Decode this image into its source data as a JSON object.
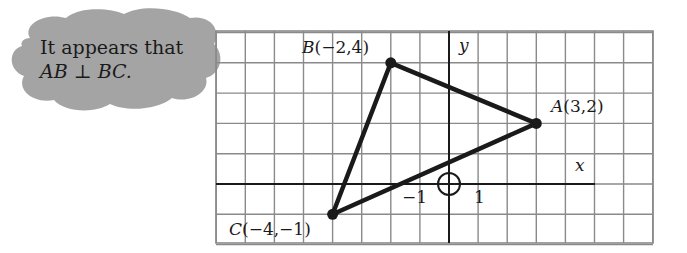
{
  "callout": {
    "line1": "It appears that",
    "line2_left": "AB",
    "line2_symbol": "⊥",
    "line2_right": "BC."
  },
  "axes": {
    "x_label": "x",
    "y_label": "y",
    "tick_neg1": "−1",
    "tick_pos1": "1"
  },
  "points": {
    "A": {
      "name": "A",
      "coords": "(3,2)",
      "x": 3,
      "y": 2
    },
    "B": {
      "name": "B",
      "coords": "(−2,4)",
      "x": -2,
      "y": 4
    },
    "C": {
      "name": "C",
      "coords": "(−4,−1)",
      "x": -4,
      "y": -1
    }
  },
  "grid": {
    "x_min": -8,
    "x_max": 7,
    "y_min": -2,
    "y_max": 5,
    "line_color": "#8a8a8a",
    "axis_color": "#1a1a1a",
    "segment_color": "#1a1a1a",
    "callout_fill": "#9a9a9a"
  }
}
